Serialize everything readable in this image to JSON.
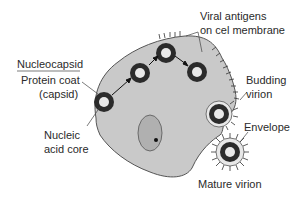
{
  "diagram": {
    "labels": {
      "nucleocapsid": "Nucleocapsid",
      "protein_coat_line1": "Protein coat",
      "protein_coat_line2": "(capsid)",
      "nucleic_line1": "Nucleic",
      "nucleic_line2": "acid core",
      "antigens_line1": "Viral antigens",
      "antigens_line2": "on cel membrane",
      "budding_line1": "Budding",
      "budding_line2": "virion",
      "envelope": "Envelope",
      "mature": "Mature virion"
    },
    "colors": {
      "cell_fill": "#c9c9c9",
      "cell_stroke": "#555555",
      "capsid": "#2b2b2b",
      "core": "#e8e8e8",
      "nucleus_fill": "#b0b0b0"
    }
  }
}
